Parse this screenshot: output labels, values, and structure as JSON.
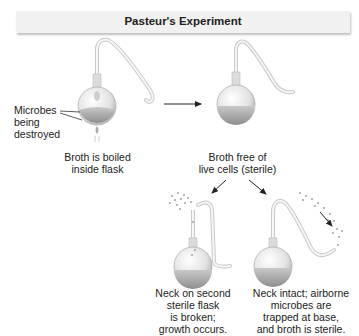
{
  "title": "Pasteur's Experiment",
  "steps": [
    {
      "id": "boil",
      "caption": [
        "Broth is boiled",
        "inside flask"
      ],
      "annotation": [
        "Microbes",
        "being",
        "destroyed"
      ]
    },
    {
      "id": "sterile",
      "caption": [
        "Broth free of",
        "live cells (sterile)"
      ]
    },
    {
      "id": "broken-neck",
      "caption": [
        "Neck on second",
        "sterile flask",
        "is broken;",
        "growth occurs."
      ]
    },
    {
      "id": "intact-neck",
      "caption": [
        "Neck intact; airborne",
        "microbes are",
        "trapped at base,",
        "and broth is sterile."
      ]
    }
  ],
  "colors": {
    "header_bg": "#f1f1f1",
    "glass": "#e6e6e6",
    "broth": "#a9a9a9",
    "arrow": "#222222"
  }
}
